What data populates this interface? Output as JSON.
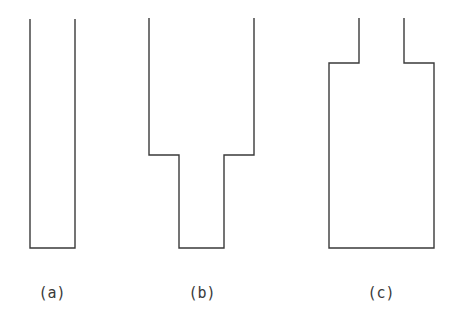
{
  "figure": {
    "stroke_color": "#3a3a3a",
    "background": "#ffffff",
    "panels": [
      {
        "id": "a",
        "label": "(a)",
        "description": "uniform-width container (open top)",
        "path": "M30,19 L30,248 L75,248 L75,19",
        "label_x": 52
      },
      {
        "id": "b",
        "label": "(b)",
        "description": "wide top section stepping down to a narrow bottom section",
        "path": "M149,18 L149,155 L179,155 L179,248 L224,248 L224,155 L254,155 L254,18",
        "label_x": 202
      },
      {
        "id": "c",
        "label": "(c)",
        "description": "narrow neck opening into a wide bottom body",
        "path": "M359,18 L359,63 L329,63 L329,248 L434,248 L434,63 L404,63 L404,18",
        "label_x": 381
      }
    ]
  }
}
